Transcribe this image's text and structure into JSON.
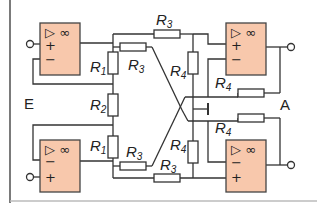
{
  "diagram": {
    "type": "circuit-schematic",
    "colors": {
      "opamp_fill": "#f8c8ac",
      "line": "#333333",
      "background": "#ffffff"
    },
    "labels": {
      "input": "E",
      "output": "A"
    },
    "opamps": [
      {
        "id": "top-left",
        "symbol": "▷ ∞",
        "plus": "+",
        "minus": "−"
      },
      {
        "id": "bottom-left",
        "symbol": "▷ ∞",
        "plus": "+",
        "minus": "−"
      },
      {
        "id": "top-right",
        "symbol": "▷ ∞",
        "plus": "+",
        "minus": "−"
      },
      {
        "id": "bottom-right",
        "symbol": "▷ ∞",
        "plus": "+",
        "minus": "−"
      }
    ],
    "resistors": [
      {
        "id": "r1-top",
        "name": "R",
        "sub": "1"
      },
      {
        "id": "r2",
        "name": "R",
        "sub": "2"
      },
      {
        "id": "r1-bottom",
        "name": "R",
        "sub": "1"
      },
      {
        "id": "r3-top-horizontal",
        "name": "R",
        "sub": "3"
      },
      {
        "id": "r3-top-diagonal",
        "name": "R",
        "sub": "3"
      },
      {
        "id": "r3-bottom-diagonal",
        "name": "R",
        "sub": "3"
      },
      {
        "id": "r3-bottom-horizontal",
        "name": "R",
        "sub": "3"
      },
      {
        "id": "r4-top-vertical",
        "name": "R",
        "sub": "4"
      },
      {
        "id": "r4-top-feedback",
        "name": "R",
        "sub": "4"
      },
      {
        "id": "r4-bottom-feedback",
        "name": "R",
        "sub": "4"
      },
      {
        "id": "r4-bottom-vertical",
        "name": "R",
        "sub": "4"
      }
    ]
  }
}
